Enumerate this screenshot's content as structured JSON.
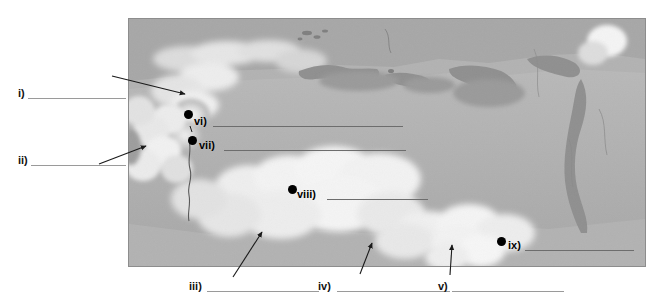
{
  "document": {
    "type": "map-labeling-worksheet",
    "title": "",
    "map_region": "Northern Eurasia / Russia physical relief map",
    "map_style": "grayscale shaded relief"
  },
  "colors": {
    "page_background": "#ffffff",
    "map_sea": "#a8a8a8",
    "map_land_low": "#b4b4b4",
    "map_land_high": "#f2f2f2",
    "map_border": "#8d8d8d",
    "marker": "#000000",
    "rule_line": "#6d6d6d",
    "leader_line": "#1a1a1a",
    "text": "#111111"
  },
  "map": {
    "frame": {
      "x": 128,
      "y": 18,
      "width": 516,
      "height": 247
    },
    "river_label": "river-line"
  },
  "labels": [
    {
      "id": "i",
      "text": "i)",
      "x": 18,
      "y": 88,
      "rule_x": 28,
      "rule_y": 98,
      "rule_w": 98,
      "placement": "left-margin",
      "pointer": "arrow"
    },
    {
      "id": "ii",
      "text": "ii)",
      "x": 18,
      "y": 155,
      "rule_x": 31,
      "rule_y": 165,
      "rule_w": 95,
      "placement": "left-margin",
      "pointer": "arrow"
    },
    {
      "id": "iii",
      "text": "iii)",
      "x": 189,
      "y": 281,
      "rule_x": 207,
      "rule_y": 291,
      "rule_w": 112,
      "placement": "bottom-margin",
      "pointer": "arrow"
    },
    {
      "id": "iv",
      "text": "iv)",
      "x": 318,
      "y": 281,
      "rule_x": 337,
      "rule_y": 291,
      "rule_w": 113,
      "placement": "bottom-margin",
      "pointer": "arrow"
    },
    {
      "id": "v",
      "text": "v)",
      "x": 438,
      "y": 281,
      "rule_x": 452,
      "rule_y": 291,
      "rule_w": 112,
      "placement": "bottom-margin",
      "pointer": "arrow"
    },
    {
      "id": "vi",
      "text": "vi)",
      "x": 194,
      "y": 116,
      "rule_x": 213,
      "rule_y": 121,
      "rule_w": 190,
      "placement": "on-map",
      "pointer": "dot"
    },
    {
      "id": "vii",
      "text": "vii)",
      "x": 199,
      "y": 140,
      "rule_x": 224,
      "rule_y": 146,
      "rule_w": 182,
      "placement": "on-map",
      "pointer": "dot"
    },
    {
      "id": "viii",
      "text": "viii)",
      "x": 297,
      "y": 189,
      "rule_x": 327,
      "rule_y": 194,
      "rule_w": 101,
      "placement": "on-map",
      "pointer": "dot"
    },
    {
      "id": "ix",
      "text": "ix)",
      "x": 508,
      "y": 240,
      "rule_x": 525,
      "rule_y": 245,
      "rule_w": 109,
      "placement": "on-map",
      "pointer": "dot"
    }
  ],
  "markers": [
    {
      "for": "vi",
      "name": "point-marker-vi",
      "x": 184,
      "y": 110
    },
    {
      "for": "vii",
      "name": "point-marker-vii",
      "x": 188,
      "y": 136
    },
    {
      "for": "viii",
      "name": "point-marker-viii",
      "x": 288,
      "y": 185
    },
    {
      "for": "ix",
      "name": "point-marker-ix",
      "x": 497,
      "y": 237
    }
  ],
  "arrows": [
    {
      "for": "i",
      "name": "leader-arrow-i",
      "x1": 112,
      "y1": 76,
      "x2": 187,
      "y2": 95
    },
    {
      "for": "ii",
      "name": "leader-arrow-ii",
      "x1": 99,
      "y1": 163,
      "x2": 148,
      "y2": 146
    },
    {
      "for": "iii",
      "name": "leader-arrow-iii",
      "x1": 232,
      "y1": 277,
      "x2": 262,
      "y2": 232
    },
    {
      "for": "iv",
      "name": "leader-arrow-iv",
      "x1": 360,
      "y1": 274,
      "x2": 372,
      "y2": 243
    },
    {
      "for": "v",
      "name": "leader-arrow-v",
      "x1": 449,
      "y1": 275,
      "x2": 452,
      "y2": 245
    }
  ]
}
